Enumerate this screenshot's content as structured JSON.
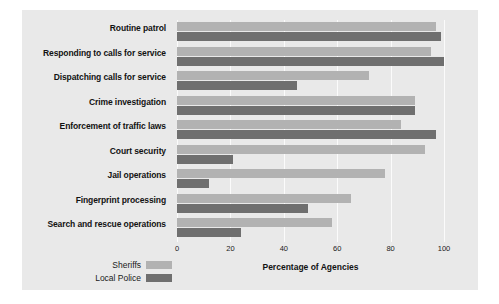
{
  "chart_data": {
    "type": "bar",
    "orientation": "horizontal",
    "title": "",
    "xlabel": "Percentage of Agencies",
    "ylabel": "",
    "xlim": [
      0,
      100
    ],
    "xticks": [
      0,
      20,
      40,
      60,
      80,
      100
    ],
    "xtick_labels": [
      "0",
      "20",
      "40",
      "60",
      "80",
      "100"
    ],
    "grid": true,
    "legend_position": "bottom-left",
    "categories": [
      "Routine patrol",
      "Responding to calls for service",
      "Dispatching calls for service",
      "Crime investigation",
      "Enforcement of traffic laws",
      "Court security",
      "Jail operations",
      "Fingerprint processing",
      "Search and rescue operations"
    ],
    "series": [
      {
        "name": "Sheriffs",
        "color": "#b2b2b2",
        "values": [
          97,
          95,
          72,
          89,
          84,
          93,
          78,
          65,
          58
        ]
      },
      {
        "name": "Local Police",
        "color": "#6f6f6f",
        "values": [
          99,
          100,
          45,
          89,
          97,
          21,
          12,
          49,
          24
        ]
      }
    ]
  },
  "legend": {
    "items": [
      {
        "label": "Sheriffs",
        "swatch": "sheriffs"
      },
      {
        "label": "Local Police",
        "swatch": "police"
      }
    ]
  },
  "colors": {
    "panel_background": "#e9e9e9",
    "gridline": "#fbfbfb",
    "sheriffs": "#b2b2b2",
    "local_police": "#6f6f6f",
    "text": "#121212"
  }
}
